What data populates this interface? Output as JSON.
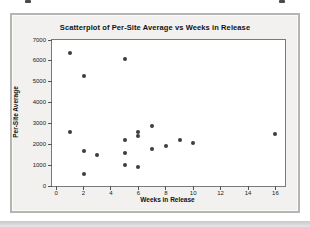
{
  "chart_data": {
    "type": "scatter",
    "title": "Scatterplot of Per-Site Average vs Weeks in Release",
    "xlabel": "Weeks in Release",
    "ylabel": "Per-Site Average",
    "xlim": [
      -0.3,
      16.7
    ],
    "ylim": [
      0,
      7000
    ],
    "x_ticks": [
      0,
      2,
      4,
      6,
      8,
      10,
      12,
      14,
      16
    ],
    "y_ticks": [
      0,
      1000,
      2000,
      3000,
      4000,
      5000,
      6000,
      7000
    ],
    "grid": "off",
    "legend": "none",
    "point_color": "#3d3d3d",
    "plot_bg": "#ffffff",
    "panel_bg": "#f2f1ef",
    "points": [
      {
        "x": 1,
        "y": 6400
      },
      {
        "x": 1,
        "y": 2600
      },
      {
        "x": 2,
        "y": 5300
      },
      {
        "x": 2,
        "y": 1700
      },
      {
        "x": 2,
        "y": 600
      },
      {
        "x": 3,
        "y": 1500
      },
      {
        "x": 5,
        "y": 6100
      },
      {
        "x": 5,
        "y": 2200
      },
      {
        "x": 5,
        "y": 1600
      },
      {
        "x": 5,
        "y": 1000
      },
      {
        "x": 6,
        "y": 2600
      },
      {
        "x": 6,
        "y": 2400
      },
      {
        "x": 6,
        "y": 900
      },
      {
        "x": 7,
        "y": 2900
      },
      {
        "x": 7,
        "y": 1800
      },
      {
        "x": 8,
        "y": 1900
      },
      {
        "x": 9,
        "y": 2200
      },
      {
        "x": 10,
        "y": 2050
      },
      {
        "x": 16,
        "y": 2500
      }
    ]
  }
}
